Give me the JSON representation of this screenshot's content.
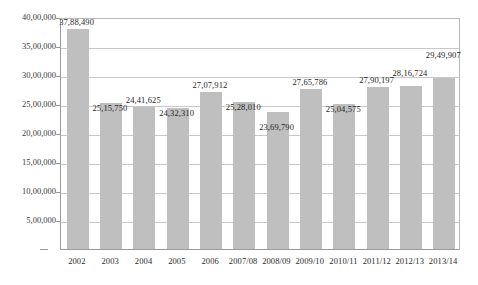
{
  "chart_data": {
    "type": "bar",
    "title": "",
    "subtitle": "",
    "xlabel": "",
    "ylabel": "",
    "categories": [
      "2002",
      "2003",
      "2004",
      "2005",
      "2006",
      "2007/08",
      "2008/09",
      "2009/10",
      "2010/11",
      "2011/12",
      "2012/13",
      "2013/14"
    ],
    "values": [
      3788490,
      2515750,
      2441625,
      2432310,
      2707912,
      2528010,
      2369790,
      2765786,
      2504575,
      2790197,
      2816724,
      2949907
    ],
    "data_labels": [
      "37,88,490",
      "25,15,750",
      "24,41,625",
      "24,32,310",
      "27,07,912",
      "25,28,010",
      "23,69,790",
      "27,65,786",
      "25,04,575",
      "27,90,197",
      "28,16,724",
      "29,49,907"
    ],
    "ylim": [
      0,
      4000000
    ],
    "ytick_values": [
      500000,
      1000000,
      1500000,
      2000000,
      2500000,
      3000000,
      3500000,
      4000000
    ],
    "ytick_labels": [
      "5,00,000",
      "10,00,000",
      "15,00,000",
      "20,00,000",
      "25,00,000",
      "30,00,000",
      "35,00,000",
      "40,00,000"
    ],
    "grid": true,
    "legend": false,
    "legend_position": "none",
    "bar_color": "#bfbfbf",
    "gridline_color": "#c8c8c8",
    "axis_color": "#9a9a9a",
    "background_color": "#ffffff",
    "label_color": "#1f1f1f"
  }
}
